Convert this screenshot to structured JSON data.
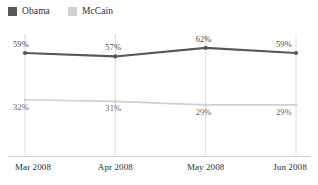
{
  "legend": {
    "position": "top-left",
    "items": [
      {
        "label": "Obama",
        "color": "#585858"
      },
      {
        "label": "McCain",
        "color": "#d0d0d0"
      }
    ]
  },
  "axis": {
    "line_color": "#cfcfcf",
    "gridline_color": "#dcdcdc"
  },
  "chart_data": {
    "type": "line",
    "title": "",
    "subtitle": "",
    "xlabel": "",
    "ylabel": "",
    "categories": [
      "Mar 2008",
      "Apr 2008",
      "May 2008",
      "Jun 2008"
    ],
    "ylim": [
      0,
      70
    ],
    "grid": "vertical",
    "legend_position": "top-left",
    "value_suffix": "%",
    "series": [
      {
        "name": "Obama",
        "color": "#585858",
        "values": [
          59,
          57,
          62,
          59
        ],
        "labels": [
          "59%",
          "57%",
          "62%",
          "59%"
        ]
      },
      {
        "name": "McCain",
        "color": "#d0d0d0",
        "values": [
          32,
          31,
          29,
          29
        ],
        "labels": [
          "32%",
          "31%",
          "29%",
          "29%"
        ]
      }
    ]
  }
}
